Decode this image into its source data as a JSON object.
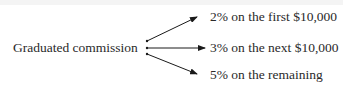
{
  "diagram": {
    "source_label": "Graduated commission",
    "branches": [
      {
        "label": "2% on the first $10,000"
      },
      {
        "label": "3% on the next $10,000"
      },
      {
        "label": "5% on the remaining"
      }
    ],
    "colors": {
      "text": "#2a2a2a",
      "arrow": "#1a1a1a"
    }
  }
}
